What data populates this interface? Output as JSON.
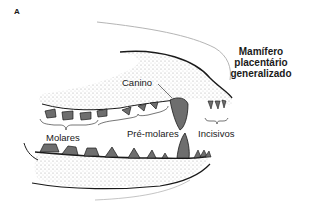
{
  "figure": {
    "panel_letter": "A",
    "title_lines": [
      "Mamífero",
      "placentário",
      "generalizado"
    ],
    "labels": {
      "canine": "Canino",
      "molars": "Molares",
      "premolars": "Pré-molares",
      "incisors": "Incisivos"
    },
    "colors": {
      "tooth_fill": "#6e6e6e",
      "outline": "#1a1a1a",
      "stipple": "#9a9a9a",
      "background": "#ffffff",
      "skull_outline": "#b5b5b5"
    }
  }
}
